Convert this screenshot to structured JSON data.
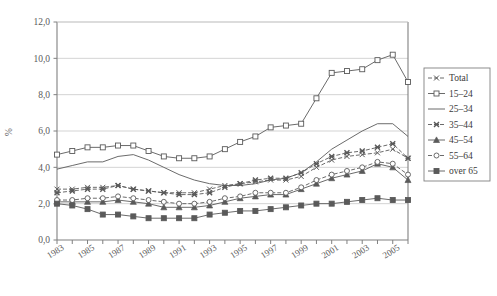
{
  "chart_data": {
    "type": "line",
    "title": "",
    "xlabel": "",
    "ylabel": "%",
    "ylim": [
      0.0,
      12.0
    ],
    "yticks": [
      "0,0",
      "2,0",
      "4,0",
      "6,0",
      "8,0",
      "10,0",
      "12,0"
    ],
    "ytick_values": [
      0,
      2,
      4,
      6,
      8,
      10,
      12
    ],
    "grid": true,
    "legend_position": "right",
    "x": [
      1983,
      1984,
      1985,
      1986,
      1987,
      1988,
      1989,
      1990,
      1991,
      1992,
      1993,
      1994,
      1995,
      1996,
      1997,
      1998,
      1999,
      2000,
      2001,
      2002,
      2003,
      2004,
      2005,
      2006
    ],
    "xtick_labels": [
      "1983",
      "1985",
      "1987",
      "1989",
      "1991",
      "1993",
      "1995",
      "1997",
      "1999",
      "2001",
      "2003",
      "2005"
    ],
    "xtick_values": [
      1983,
      1985,
      1987,
      1989,
      1991,
      1993,
      1995,
      1997,
      1999,
      2001,
      2003,
      2005
    ],
    "series": [
      {
        "name": "Total",
        "marker": "x",
        "dash": "4,2",
        "values": [
          2.8,
          2.8,
          2.9,
          2.9,
          3.0,
          2.8,
          2.7,
          2.6,
          2.6,
          2.6,
          2.8,
          3.0,
          3.1,
          3.2,
          3.3,
          3.3,
          3.5,
          4.0,
          4.4,
          4.6,
          4.7,
          4.8,
          5.0,
          4.5
        ]
      },
      {
        "name": "15–24",
        "marker": "square-open",
        "dash": "none",
        "values": [
          4.7,
          4.9,
          5.1,
          5.1,
          5.2,
          5.2,
          4.9,
          4.6,
          4.5,
          4.5,
          4.6,
          5.0,
          5.4,
          5.7,
          6.2,
          6.3,
          6.4,
          7.8,
          9.2,
          9.3,
          9.4,
          9.9,
          10.2,
          8.7
        ]
      },
      {
        "name": "25–34",
        "marker": "none",
        "dash": "none",
        "values": [
          3.9,
          4.1,
          4.3,
          4.3,
          4.6,
          4.7,
          4.4,
          4.0,
          3.6,
          3.3,
          3.1,
          3.0,
          3.0,
          3.1,
          3.3,
          3.4,
          3.7,
          4.3,
          5.0,
          5.5,
          6.0,
          6.4,
          6.4,
          5.7
        ]
      },
      {
        "name": "35–44",
        "marker": "x-filled",
        "dash": "4,2",
        "values": [
          2.6,
          2.7,
          2.8,
          2.8,
          3.0,
          2.8,
          2.7,
          2.6,
          2.5,
          2.5,
          2.6,
          2.9,
          3.1,
          3.3,
          3.4,
          3.4,
          3.7,
          4.2,
          4.6,
          4.8,
          4.9,
          5.1,
          5.3,
          4.5
        ]
      },
      {
        "name": "45–54",
        "marker": "triangle",
        "dash": "none",
        "values": [
          2.1,
          2.1,
          2.1,
          2.1,
          2.2,
          2.1,
          2.0,
          1.8,
          1.8,
          1.8,
          1.9,
          2.1,
          2.3,
          2.4,
          2.5,
          2.5,
          2.8,
          3.1,
          3.4,
          3.6,
          3.8,
          4.2,
          4.0,
          3.3
        ]
      },
      {
        "name": "55–64",
        "marker": "circle-open",
        "dash": "4,2",
        "values": [
          2.2,
          2.2,
          2.3,
          2.3,
          2.4,
          2.3,
          2.2,
          2.1,
          2.0,
          2.0,
          2.1,
          2.3,
          2.4,
          2.6,
          2.6,
          2.6,
          2.9,
          3.3,
          3.6,
          3.8,
          4.0,
          4.3,
          4.2,
          3.6
        ]
      },
      {
        "name": "over 65",
        "marker": "square-filled",
        "dash": "none",
        "values": [
          2.0,
          1.9,
          1.7,
          1.4,
          1.4,
          1.3,
          1.2,
          1.2,
          1.2,
          1.2,
          1.4,
          1.5,
          1.6,
          1.6,
          1.7,
          1.8,
          1.9,
          2.0,
          2.0,
          2.1,
          2.2,
          2.3,
          2.2,
          2.2
        ]
      }
    ]
  },
  "colors": {
    "line": "#5a5a5a",
    "grid": "#c8c8c8",
    "axis": "#808080",
    "text": "#3b3b3b",
    "background": "#ffffff"
  }
}
